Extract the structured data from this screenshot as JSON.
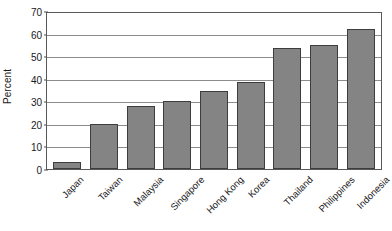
{
  "chart_data": {
    "type": "bar",
    "title": "",
    "xlabel": "",
    "ylabel": "Percent",
    "ylim": [
      0,
      70
    ],
    "ytick_step": 10,
    "yticks": [
      0,
      10,
      20,
      30,
      40,
      50,
      60,
      70
    ],
    "grid": true,
    "legend": false,
    "xtick_rotation": -45,
    "categories": [
      "Japan",
      "Taiwan",
      "Malaysia",
      "Singapore",
      "Hong Kong",
      "Korea",
      "Thailand",
      "Philippines",
      "Indonesia"
    ],
    "values": [
      3,
      20,
      28,
      30,
      34.5,
      38.5,
      53.5,
      55,
      62
    ],
    "bar_color": "#848484",
    "bar_edge_color": "#3d3d3d",
    "gridline_color": "#8c8c8c",
    "axis_color": "#595959",
    "text_color": "#1a1a1a"
  }
}
